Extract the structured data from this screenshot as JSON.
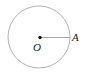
{
  "figure": {
    "type": "geometry-diagram",
    "background_color": "#ffffff",
    "width": 90,
    "height": 74,
    "circle": {
      "name": "circle-outline",
      "center_x": 39,
      "center_y": 37,
      "radius": 31,
      "stroke_color": "#b3b3b3",
      "stroke_width": 1,
      "fill": "none"
    },
    "center_point": {
      "name": "center-point-dot",
      "x": 40,
      "y": 37.5,
      "radius": 1.7,
      "fill_color": "#111111"
    },
    "radius_segment": {
      "name": "radius-segment",
      "x1": 40,
      "y1": 37.5,
      "x2": 70,
      "y2": 37.5,
      "stroke_color": "#a8a8a8",
      "stroke_width": 1
    },
    "labels": {
      "center": "O",
      "point_a": "A"
    }
  }
}
